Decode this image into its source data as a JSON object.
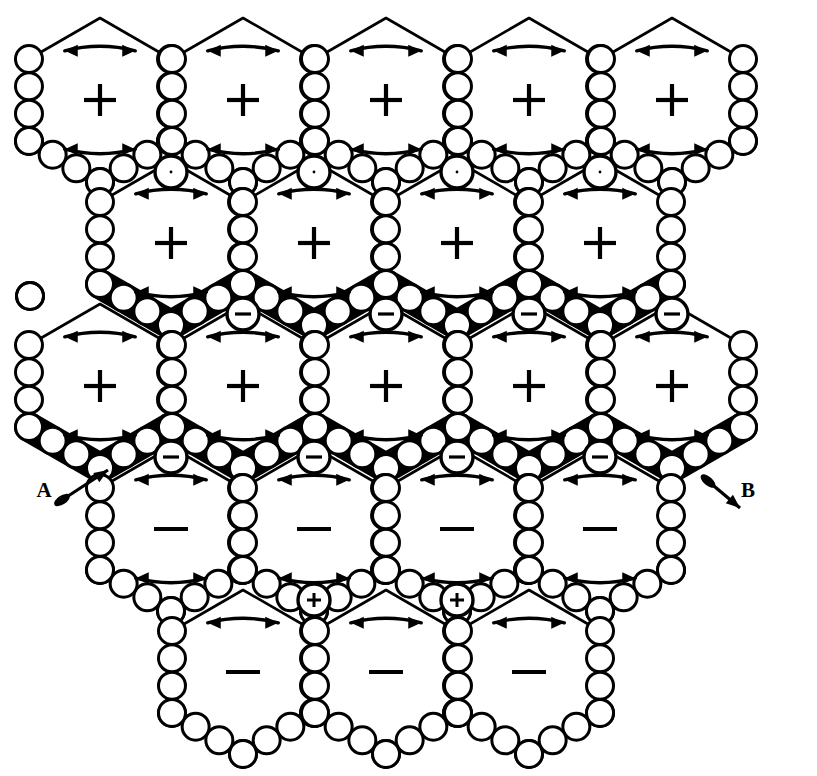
{
  "figure": {
    "type": "hexagonal-convection-cell-pattern",
    "background_color": "#ffffff",
    "ink_color": "#000000",
    "width": 817,
    "height": 776
  },
  "annotations": [
    {
      "id": "A",
      "label": "A",
      "x": 44,
      "y": 492,
      "arrow_from": [
        62,
        500
      ],
      "arrow_to": [
        108,
        470
      ],
      "arrow_style": "blob-tail-pointed-head",
      "direction": "up-right"
    },
    {
      "id": "B",
      "label": "B",
      "x": 748,
      "y": 492,
      "arrow_from": [
        708,
        481
      ],
      "arrow_to": [
        740,
        508
      ],
      "arrow_style": "blob-tail-pointed-head",
      "direction": "down-right"
    }
  ],
  "legend_symbols": {
    "plus": "+",
    "minus": "−",
    "cell_wall": "circle-chain",
    "grain_boundary": "thick-black-band",
    "circulation": "double-headed-arc-arrow"
  },
  "grid": {
    "hex_radius": 82,
    "row_pitch": 142,
    "col_pitch": 142,
    "rows": [
      {
        "index": 0,
        "cy": 100,
        "sign": "+",
        "cxs": [
          100,
          243,
          386,
          529,
          672
        ],
        "band_below": false
      },
      {
        "index": 1,
        "cy": 243,
        "sign": "+",
        "cxs": [
          171,
          314,
          457,
          600
        ],
        "band_below": true
      },
      {
        "index": 2,
        "cy": 386,
        "sign": "+",
        "cxs": [
          100,
          243,
          386,
          529,
          672
        ],
        "band_below": true
      },
      {
        "index": 3,
        "cy": 529,
        "sign": "−",
        "cxs": [
          171,
          314,
          457,
          600
        ],
        "band_below": false
      },
      {
        "index": 4,
        "cy": 672,
        "sign": "−",
        "cxs": [
          243,
          386,
          529
        ],
        "band_below": false
      }
    ]
  },
  "cells": [
    {
      "row": 0,
      "col": 0,
      "cx": 100,
      "cy": 100,
      "sign": "+",
      "top_arrow": "left",
      "bottom_arrow": "right"
    },
    {
      "row": 0,
      "col": 1,
      "cx": 243,
      "cy": 100,
      "sign": "+",
      "top_arrow": "left",
      "bottom_arrow": "right"
    },
    {
      "row": 0,
      "col": 2,
      "cx": 386,
      "cy": 100,
      "sign": "+",
      "top_arrow": "left",
      "bottom_arrow": "right"
    },
    {
      "row": 0,
      "col": 3,
      "cx": 529,
      "cy": 100,
      "sign": "+",
      "top_arrow": "left",
      "bottom_arrow": "right"
    },
    {
      "row": 0,
      "col": 4,
      "cx": 672,
      "cy": 100,
      "sign": "+",
      "top_arrow": "left",
      "bottom_arrow": "right"
    },
    {
      "row": 1,
      "col": 0,
      "cx": 171,
      "cy": 243,
      "sign": "+",
      "top_arrow": "left",
      "bottom_arrow": "right"
    },
    {
      "row": 1,
      "col": 1,
      "cx": 314,
      "cy": 243,
      "sign": "+",
      "top_arrow": "left",
      "bottom_arrow": "right"
    },
    {
      "row": 1,
      "col": 2,
      "cx": 457,
      "cy": 243,
      "sign": "+",
      "top_arrow": "left",
      "bottom_arrow": "right"
    },
    {
      "row": 1,
      "col": 3,
      "cx": 600,
      "cy": 243,
      "sign": "+",
      "top_arrow": "left",
      "bottom_arrow": "right"
    },
    {
      "row": 2,
      "col": 0,
      "cx": 100,
      "cy": 386,
      "sign": "+",
      "top_arrow": "left",
      "bottom_arrow": "right"
    },
    {
      "row": 2,
      "col": 1,
      "cx": 243,
      "cy": 386,
      "sign": "+",
      "top_arrow": "left",
      "bottom_arrow": "right"
    },
    {
      "row": 2,
      "col": 2,
      "cx": 386,
      "cy": 386,
      "sign": "+",
      "top_arrow": "left",
      "bottom_arrow": "right"
    },
    {
      "row": 2,
      "col": 3,
      "cx": 529,
      "cy": 386,
      "sign": "+",
      "top_arrow": "left",
      "bottom_arrow": "right"
    },
    {
      "row": 2,
      "col": 4,
      "cx": 672,
      "cy": 386,
      "sign": "+",
      "top_arrow": "left",
      "bottom_arrow": "right"
    },
    {
      "row": 3,
      "col": 0,
      "cx": 171,
      "cy": 529,
      "sign": "−",
      "top_arrow": "left",
      "bottom_arrow": "left"
    },
    {
      "row": 3,
      "col": 1,
      "cx": 314,
      "cy": 529,
      "sign": "−",
      "top_arrow": "left",
      "bottom_arrow": "left"
    },
    {
      "row": 3,
      "col": 2,
      "cx": 457,
      "cy": 529,
      "sign": "−",
      "top_arrow": "left",
      "bottom_arrow": "left"
    },
    {
      "row": 3,
      "col": 3,
      "cx": 600,
      "cy": 529,
      "sign": "−",
      "top_arrow": "left",
      "bottom_arrow": "left"
    },
    {
      "row": 4,
      "col": 0,
      "cx": 243,
      "cy": 672,
      "sign": "−",
      "top_arrow": "left",
      "bottom_arrow": "none"
    },
    {
      "row": 4,
      "col": 1,
      "cx": 386,
      "cy": 672,
      "sign": "−",
      "top_arrow": "left",
      "bottom_arrow": "none"
    },
    {
      "row": 4,
      "col": 2,
      "cx": 529,
      "cy": 672,
      "sign": "−",
      "top_arrow": "left",
      "bottom_arrow": "none"
    }
  ],
  "junction_nodes": [
    {
      "x": 171,
      "y": 172,
      "sign": ""
    },
    {
      "x": 314,
      "y": 172,
      "sign": ""
    },
    {
      "x": 457,
      "y": 172,
      "sign": ""
    },
    {
      "x": 600,
      "y": 172,
      "sign": ""
    },
    {
      "x": 243,
      "y": 314,
      "sign": "−"
    },
    {
      "x": 386,
      "y": 314,
      "sign": "−"
    },
    {
      "x": 529,
      "y": 314,
      "sign": "−"
    },
    {
      "x": 672,
      "y": 314,
      "sign": "−"
    },
    {
      "x": 171,
      "y": 457,
      "sign": "−"
    },
    {
      "x": 314,
      "y": 457,
      "sign": "−"
    },
    {
      "x": 457,
      "y": 457,
      "sign": "−"
    },
    {
      "x": 600,
      "y": 457,
      "sign": "−"
    },
    {
      "x": 314,
      "y": 600,
      "sign": "+"
    },
    {
      "x": 457,
      "y": 600,
      "sign": "+"
    }
  ]
}
